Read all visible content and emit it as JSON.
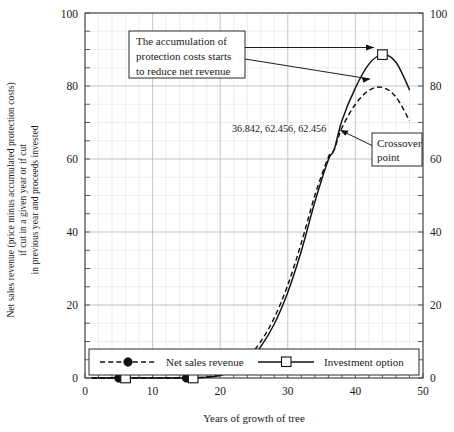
{
  "chart_data": {
    "type": "line",
    "title": "",
    "xlabel": "Years of growth of tree",
    "ylabel_lines": [
      "Net sales revenue (price minus accumulated protection costs)",
      "if cut in a given year or if cut",
      "in previous year and proceeds invested"
    ],
    "xlim": [
      0,
      50
    ],
    "ylim": [
      0,
      100
    ],
    "xticks": [
      0,
      10,
      20,
      30,
      40,
      50
    ],
    "yticks": [
      0,
      20,
      40,
      60,
      80,
      100
    ],
    "right_axis_ticks": [
      0,
      20,
      40,
      60,
      80,
      100
    ],
    "grid": true,
    "grid_minor_x_step": 2,
    "grid_minor_y_step": 5,
    "legend_position": "bottom-inside",
    "series": [
      {
        "name": "Net sales revenue",
        "style": "dashed",
        "marker": "filled-circle",
        "x": [
          1,
          5,
          10,
          15,
          18,
          20,
          22,
          24,
          26,
          28,
          30,
          32,
          34,
          36,
          36.842,
          38,
          40,
          42,
          44,
          46,
          48
        ],
        "values": [
          0,
          0,
          0,
          0,
          0.3,
          1.0,
          2.6,
          5.4,
          10.0,
          16.5,
          25.5,
          37.0,
          50.0,
          60.5,
          62.456,
          68.5,
          75.0,
          78.8,
          79.6,
          77.0,
          70.5
        ]
      },
      {
        "name": "Investment option",
        "style": "solid",
        "marker": "open-square",
        "x": [
          1,
          5,
          10,
          15,
          18,
          20,
          22,
          24,
          26,
          28,
          30,
          32,
          34,
          36,
          36.842,
          38,
          40,
          42,
          44,
          46,
          48
        ],
        "values": [
          0,
          0,
          0,
          0,
          0.2,
          0.7,
          2.0,
          4.4,
          8.6,
          14.8,
          23.5,
          34.8,
          48.2,
          59.8,
          62.456,
          70.5,
          79.5,
          86.0,
          88.6,
          86.5,
          79.0
        ]
      }
    ],
    "flat_markers": [
      {
        "x": 5,
        "y": 0,
        "marker": "filled-circle"
      },
      {
        "x": 6,
        "y": 0,
        "marker": "open-square"
      },
      {
        "x": 15,
        "y": 0,
        "marker": "filled-circle"
      },
      {
        "x": 16,
        "y": 0,
        "marker": "open-square"
      }
    ],
    "peak_marker": {
      "x": 44,
      "y": 88.6,
      "marker": "open-square"
    },
    "data_point_label": "36.842, 62.456, 62.456",
    "annotations": [
      {
        "name": "accumulation-note",
        "lines": [
          "The accumulation of",
          "protection costs starts",
          "to reduce net revenue"
        ]
      },
      {
        "name": "crossover-note",
        "lines": [
          "Crossover",
          "point"
        ]
      }
    ]
  },
  "legend": {
    "items": [
      {
        "label": "Net sales revenue",
        "style": "dashed",
        "marker": "filled-circle"
      },
      {
        "label": "Investment option",
        "style": "solid",
        "marker": "open-square"
      }
    ]
  },
  "axes": {
    "x_tick_labels": [
      "0",
      "10",
      "20",
      "30",
      "40",
      "50"
    ],
    "y_tick_labels": [
      "0",
      "20",
      "40",
      "60",
      "80",
      "100"
    ],
    "y_right_tick_labels": [
      "0",
      "20",
      "40",
      "60",
      "80",
      "100"
    ],
    "x_title": "Years of growth of tree",
    "y_title_line1": "Net sales revenue (price minus accumulated protection costs)",
    "y_title_line2": "if cut in a given year or if cut",
    "y_title_line3": "in previous year and proceeds invested"
  },
  "annotation_box_1": {
    "line1": "The accumulation of",
    "line2": "protection costs starts",
    "line3": "to reduce net revenue"
  },
  "annotation_box_2": {
    "line1": "Crossover",
    "line2": "point"
  },
  "point_label": {
    "text": "36.842, 62.456, 62.456"
  },
  "colors": {
    "line": "#111111",
    "grid_minor": "#d9d9e0",
    "grid_major": "#b9b9c4",
    "frame": "#4a4a4a",
    "background": "#ffffff"
  }
}
